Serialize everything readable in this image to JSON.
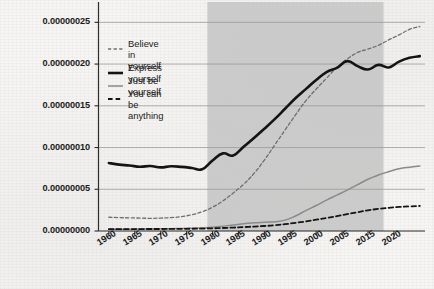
{
  "chart_data": {
    "type": "line",
    "title": "",
    "xlabel": "",
    "ylabel": "",
    "xlim": [
      1958,
      2021
    ],
    "ylim": [
      0.0,
      2.6e-07
    ],
    "grid": true,
    "legend_position": "upper-left-inside",
    "y_tick_labels": [
      "0.00000025",
      "0.00000020",
      "0.00000015",
      "0.00000010",
      "0.00000005",
      "0.00000000"
    ],
    "y_tick_values": [
      2.5e-07,
      2e-07,
      1.5e-07,
      1e-07,
      5e-08,
      0.0
    ],
    "x_tick_labels": [
      "1960",
      "1965",
      "1970",
      "1975",
      "1980",
      "1985",
      "1990",
      "1995",
      "2000",
      "2005",
      "2015",
      "2020"
    ],
    "x_tick_values": [
      1960,
      1965,
      1970,
      1975,
      1980,
      1985,
      1990,
      1995,
      2000,
      2005,
      2010,
      2015
    ],
    "highlight_span": {
      "label": "",
      "x_start": 1979,
      "x_end": 2013,
      "color": "#c8c8c8"
    },
    "x": [
      1960,
      1962,
      1964,
      1966,
      1968,
      1970,
      1972,
      1974,
      1976,
      1978,
      1980,
      1982,
      1984,
      1986,
      1988,
      1990,
      1992,
      1994,
      1996,
      1998,
      2000,
      2002,
      2004,
      2006,
      2008,
      2010,
      2012,
      2014,
      2016,
      2018,
      2020
    ],
    "series": [
      {
        "name": "Believe in yourself",
        "style": "dotted",
        "color": "#6e6e6e",
        "width": 1.3,
        "values": [
          1.65e-08,
          1.6e-08,
          1.58e-08,
          1.55e-08,
          1.52e-08,
          1.55e-08,
          1.6e-08,
          1.72e-08,
          1.95e-08,
          2.3e-08,
          2.85e-08,
          3.6e-08,
          4.55e-08,
          5.6e-08,
          6.9e-08,
          8.5e-08,
          1.03e-07,
          1.21e-07,
          1.39e-07,
          1.56e-07,
          1.7e-07,
          1.83e-07,
          1.96e-07,
          2.06e-07,
          2.14e-07,
          2.18e-07,
          2.225e-07,
          2.29e-07,
          2.35e-07,
          2.415e-07,
          2.45e-07
        ]
      },
      {
        "name": "Express yourself",
        "style": "solid-thick",
        "color": "#141414",
        "width": 2.6,
        "values": [
          8.15e-08,
          7.95e-08,
          7.85e-08,
          7.7e-08,
          7.78e-08,
          7.62e-08,
          7.75e-08,
          7.68e-08,
          7.55e-08,
          7.4e-08,
          8.45e-08,
          9.3e-08,
          9.05e-08,
          1.01e-07,
          1.115e-07,
          1.225e-07,
          1.34e-07,
          1.465e-07,
          1.59e-07,
          1.7e-07,
          1.81e-07,
          1.905e-07,
          1.955e-07,
          2.035e-07,
          1.975e-07,
          1.935e-07,
          1.99e-07,
          1.96e-07,
          2.03e-07,
          2.075e-07,
          2.095e-07
        ]
      },
      {
        "name": "Just be yourself",
        "style": "solid-thin",
        "color": "#8a8a8a",
        "width": 1.5,
        "values": [
          2e-09,
          2.1e-09,
          2.2e-09,
          2.3e-09,
          2.4e-09,
          2.6e-09,
          2.8e-09,
          3.1e-09,
          3.4e-09,
          3.8e-09,
          4.5e-09,
          5.8e-09,
          7.2e-09,
          8.8e-09,
          9.8e-09,
          1.05e-08,
          1.12e-08,
          1.3e-08,
          1.8e-08,
          2.45e-08,
          3.05e-08,
          3.7e-08,
          4.3e-08,
          4.9e-08,
          5.55e-08,
          6.2e-08,
          6.7e-08,
          7.1e-08,
          7.45e-08,
          7.65e-08,
          7.8e-08
        ]
      },
      {
        "name": "You can be anything",
        "style": "dashed",
        "color": "#141414",
        "width": 1.8,
        "values": [
          2.2e-09,
          2.2e-09,
          2.3e-09,
          2.3e-09,
          2.4e-09,
          2.4e-09,
          2.5e-09,
          2.6e-09,
          2.7e-09,
          2.9e-09,
          3.2e-09,
          3.6e-09,
          4.1e-09,
          4.7e-09,
          5.3e-09,
          6e-09,
          6.9e-09,
          8.2e-09,
          9.8e-09,
          1.15e-08,
          1.35e-08,
          1.55e-08,
          1.78e-08,
          2.02e-08,
          2.25e-08,
          2.48e-08,
          2.65e-08,
          2.78e-08,
          2.88e-08,
          2.95e-08,
          3e-08
        ]
      }
    ]
  },
  "legend": {
    "items": [
      {
        "label": "Believe in\nyourself",
        "swatch": "dotted-swatch"
      },
      {
        "label": "Express yourself",
        "swatch": "thick-line-swatch"
      },
      {
        "label": "Just be yourself",
        "swatch": "thin-line-swatch"
      },
      {
        "label": "You can be\nanything",
        "swatch": "dashed-swatch"
      }
    ]
  },
  "colors": {
    "background": "#f6f5f3",
    "axis": "#2b2b2b",
    "gridline": "#9a9a9a",
    "shaded_band": "#c8c8c8",
    "series_believe": "#6e6e6e",
    "series_express": "#141414",
    "series_just": "#8a8a8a",
    "series_anything": "#141414"
  }
}
